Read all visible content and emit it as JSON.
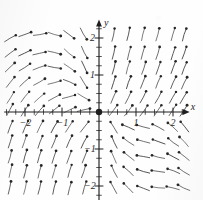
{
  "figure": {
    "kind": "direction-field",
    "background_color": "#fefefe",
    "ink_color": "#1e1e1e",
    "arrow_color": "#3a3a3a"
  },
  "axes": {
    "x_label": "x",
    "y_label": "y",
    "x_ticks": [
      {
        "value": -2,
        "label": "−2"
      },
      {
        "value": -1,
        "label": "−1"
      },
      {
        "value": 1,
        "label": "1"
      },
      {
        "value": 2,
        "label": "2"
      }
    ],
    "y_ticks": [
      {
        "value": 2,
        "label": "2"
      },
      {
        "value": 1,
        "label": "1"
      },
      {
        "value": -1,
        "label": "−1"
      },
      {
        "value": -2,
        "label": "−2"
      }
    ],
    "x_minor_tick_values": [
      -2.5,
      -2.25,
      -2,
      -1.75,
      -1.5,
      -1.25,
      -1,
      -0.75,
      -0.5,
      -0.25,
      0.25,
      0.5,
      0.75,
      1,
      1.25,
      1.5,
      1.75,
      2,
      2.25
    ],
    "y_minor_tick_values": [
      -2.25,
      -2,
      -1.75,
      -1.5,
      -1.25,
      -1,
      -0.75,
      -0.5,
      -0.25,
      0.25,
      0.5,
      0.75,
      1,
      1.25,
      1.5,
      1.75,
      2,
      2.25
    ],
    "x_range": [
      -2.55,
      2.45
    ],
    "y_range": [
      -2.45,
      2.5
    ],
    "x_axis_arrow": true,
    "y_axis_arrow": true,
    "grid": false
  },
  "equilibrium_point": {
    "x": 0,
    "y": 0,
    "marker": "filled-dot",
    "radius_px": 3.2
  },
  "chart_data": {
    "type": "scatter",
    "title": "",
    "xlabel": "x",
    "ylabel": "y",
    "xlim": [
      -2.55,
      2.45
    ],
    "ylim": [
      -2.45,
      2.5
    ],
    "grid": false,
    "legend": null,
    "sample_spacing": 0.4,
    "vector_length_px": 13,
    "arrowhead": "filled-dot",
    "field": {
      "u_expression": "-x - y",
      "v_expression": "x - y + 2*x",
      "note": "Vectors drawn as short segments with a dot head marking the direction of flow."
    },
    "vectors": [
      {
        "x": -2.4,
        "y": 2.0,
        "u": 0.86,
        "v": 0.5
      },
      {
        "x": -2.0,
        "y": 2.1,
        "u": 0.94,
        "v": 0.34
      },
      {
        "x": -1.6,
        "y": 2.1,
        "u": 0.98,
        "v": 0.17
      },
      {
        "x": -1.2,
        "y": 2.1,
        "u": 0.96,
        "v": -0.28
      },
      {
        "x": -0.8,
        "y": 2.1,
        "u": 0.8,
        "v": -0.6
      },
      {
        "x": -0.4,
        "y": 2.1,
        "u": 0.5,
        "v": -0.86
      },
      {
        "x": -2.4,
        "y": 1.6,
        "u": 0.8,
        "v": 0.6
      },
      {
        "x": -2.0,
        "y": 1.6,
        "u": 0.9,
        "v": 0.43
      },
      {
        "x": -1.6,
        "y": 1.6,
        "u": 0.97,
        "v": 0.22
      },
      {
        "x": -1.2,
        "y": 1.6,
        "u": 0.97,
        "v": -0.24
      },
      {
        "x": -0.8,
        "y": 1.6,
        "u": 0.77,
        "v": -0.64
      },
      {
        "x": -0.4,
        "y": 1.6,
        "u": 0.45,
        "v": -0.89
      },
      {
        "x": -2.4,
        "y": 1.2,
        "u": 0.72,
        "v": 0.69
      },
      {
        "x": -2.0,
        "y": 1.2,
        "u": 0.84,
        "v": 0.54
      },
      {
        "x": -1.6,
        "y": 1.2,
        "u": 0.94,
        "v": 0.34
      },
      {
        "x": -1.2,
        "y": 1.2,
        "u": 0.98,
        "v": -0.17
      },
      {
        "x": -0.8,
        "y": 1.2,
        "u": 0.82,
        "v": -0.57
      },
      {
        "x": -0.4,
        "y": 1.2,
        "u": 0.42,
        "v": -0.91
      },
      {
        "x": -2.4,
        "y": 0.8,
        "u": 0.62,
        "v": 0.78
      },
      {
        "x": -2.0,
        "y": 0.8,
        "u": 0.74,
        "v": 0.67
      },
      {
        "x": -1.6,
        "y": 0.8,
        "u": 0.87,
        "v": 0.5
      },
      {
        "x": -1.2,
        "y": 0.8,
        "u": 0.96,
        "v": 0.26
      },
      {
        "x": -0.8,
        "y": 0.8,
        "u": 0.92,
        "v": -0.4
      },
      {
        "x": -0.4,
        "y": 0.8,
        "u": 0.52,
        "v": -0.85
      },
      {
        "x": -2.4,
        "y": 0.4,
        "u": 0.52,
        "v": 0.85
      },
      {
        "x": -2.0,
        "y": 0.4,
        "u": 0.62,
        "v": 0.78
      },
      {
        "x": -1.6,
        "y": 0.4,
        "u": 0.75,
        "v": 0.66
      },
      {
        "x": -1.2,
        "y": 0.4,
        "u": 0.88,
        "v": 0.47
      },
      {
        "x": -0.8,
        "y": 0.4,
        "u": 0.96,
        "v": 0.26
      },
      {
        "x": -0.4,
        "y": 0.4,
        "u": 0.86,
        "v": -0.5
      },
      {
        "x": -2.4,
        "y": 0.05,
        "u": 0.47,
        "v": 0.88
      },
      {
        "x": -2.0,
        "y": 0.05,
        "u": 0.55,
        "v": 0.84
      },
      {
        "x": -1.6,
        "y": 0.05,
        "u": 0.66,
        "v": 0.75
      },
      {
        "x": -1.2,
        "y": 0.05,
        "u": 0.78,
        "v": 0.63
      },
      {
        "x": -0.8,
        "y": 0.05,
        "u": 0.9,
        "v": 0.43
      },
      {
        "x": -0.4,
        "y": 0.05,
        "u": 0.97,
        "v": 0.22
      },
      {
        "x": -2.4,
        "y": -0.4,
        "u": 0.36,
        "v": 0.93
      },
      {
        "x": -2.0,
        "y": -0.4,
        "u": 0.4,
        "v": 0.92
      },
      {
        "x": -1.6,
        "y": -0.4,
        "u": 0.45,
        "v": 0.89
      },
      {
        "x": -1.2,
        "y": -0.4,
        "u": 0.5,
        "v": 0.87
      },
      {
        "x": -0.8,
        "y": -0.4,
        "u": 0.55,
        "v": 0.84
      },
      {
        "x": -0.4,
        "y": -0.4,
        "u": 0.62,
        "v": 0.79
      },
      {
        "x": -2.4,
        "y": -0.8,
        "u": 0.3,
        "v": 0.95
      },
      {
        "x": -2.0,
        "y": -0.8,
        "u": 0.32,
        "v": 0.95
      },
      {
        "x": -1.6,
        "y": -0.8,
        "u": 0.35,
        "v": 0.94
      },
      {
        "x": -1.2,
        "y": -0.8,
        "u": 0.38,
        "v": 0.93
      },
      {
        "x": -0.8,
        "y": -0.8,
        "u": 0.42,
        "v": 0.91
      },
      {
        "x": -0.4,
        "y": -0.8,
        "u": 0.46,
        "v": 0.89
      },
      {
        "x": -2.4,
        "y": -1.2,
        "u": 0.26,
        "v": 0.97
      },
      {
        "x": -2.0,
        "y": -1.2,
        "u": 0.27,
        "v": 0.96
      },
      {
        "x": -1.6,
        "y": -1.2,
        "u": 0.29,
        "v": 0.96
      },
      {
        "x": -1.2,
        "y": -1.2,
        "u": 0.31,
        "v": 0.95
      },
      {
        "x": -0.8,
        "y": -1.2,
        "u": 0.34,
        "v": 0.94
      },
      {
        "x": -0.4,
        "y": -1.2,
        "u": 0.37,
        "v": 0.93
      },
      {
        "x": -2.4,
        "y": -1.6,
        "u": 0.23,
        "v": 0.97
      },
      {
        "x": -2.0,
        "y": -1.6,
        "u": 0.24,
        "v": 0.97
      },
      {
        "x": -1.6,
        "y": -1.6,
        "u": 0.25,
        "v": 0.97
      },
      {
        "x": -1.2,
        "y": -1.6,
        "u": 0.27,
        "v": 0.96
      },
      {
        "x": -0.8,
        "y": -1.6,
        "u": 0.29,
        "v": 0.96
      },
      {
        "x": -0.4,
        "y": -1.6,
        "u": 0.31,
        "v": 0.95
      },
      {
        "x": -2.4,
        "y": -2.05,
        "u": 0.21,
        "v": 0.98
      },
      {
        "x": -2.0,
        "y": -2.05,
        "u": 0.22,
        "v": 0.98
      },
      {
        "x": -1.6,
        "y": -2.05,
        "u": 0.23,
        "v": 0.97
      },
      {
        "x": -1.2,
        "y": -2.05,
        "u": 0.24,
        "v": 0.97
      },
      {
        "x": -0.8,
        "y": -2.05,
        "u": 0.26,
        "v": 0.97
      },
      {
        "x": -0.4,
        "y": -2.05,
        "u": 0.28,
        "v": 0.96
      },
      {
        "x": 0.4,
        "y": 2.1,
        "u": 0.2,
        "v": 0.98
      },
      {
        "x": 0.8,
        "y": 2.1,
        "u": 0.22,
        "v": 0.98
      },
      {
        "x": 1.2,
        "y": 2.1,
        "u": 0.24,
        "v": 0.97
      },
      {
        "x": 1.6,
        "y": 2.1,
        "u": 0.26,
        "v": 0.97
      },
      {
        "x": 2.0,
        "y": 2.1,
        "u": 0.28,
        "v": 0.96
      },
      {
        "x": 2.3,
        "y": 2.1,
        "u": 0.3,
        "v": 0.95
      },
      {
        "x": 0.4,
        "y": 1.6,
        "u": 0.22,
        "v": 0.97
      },
      {
        "x": 0.8,
        "y": 1.6,
        "u": 0.25,
        "v": 0.97
      },
      {
        "x": 1.2,
        "y": 1.6,
        "u": 0.27,
        "v": 0.96
      },
      {
        "x": 1.6,
        "y": 1.6,
        "u": 0.29,
        "v": 0.96
      },
      {
        "x": 2.0,
        "y": 1.6,
        "u": 0.31,
        "v": 0.95
      },
      {
        "x": 2.3,
        "y": 1.6,
        "u": 0.33,
        "v": 0.94
      },
      {
        "x": 0.4,
        "y": 1.2,
        "u": 0.25,
        "v": 0.97
      },
      {
        "x": 0.8,
        "y": 1.2,
        "u": 0.28,
        "v": 0.96
      },
      {
        "x": 1.2,
        "y": 1.2,
        "u": 0.31,
        "v": 0.95
      },
      {
        "x": 1.6,
        "y": 1.2,
        "u": 0.33,
        "v": 0.94
      },
      {
        "x": 2.0,
        "y": 1.2,
        "u": 0.35,
        "v": 0.94
      },
      {
        "x": 2.3,
        "y": 1.2,
        "u": 0.37,
        "v": 0.93
      },
      {
        "x": 0.4,
        "y": 0.8,
        "u": 0.3,
        "v": 0.95
      },
      {
        "x": 0.8,
        "y": 0.8,
        "u": 0.34,
        "v": 0.94
      },
      {
        "x": 1.2,
        "y": 0.8,
        "u": 0.37,
        "v": 0.93
      },
      {
        "x": 1.6,
        "y": 0.8,
        "u": 0.39,
        "v": 0.92
      },
      {
        "x": 2.0,
        "y": 0.8,
        "u": 0.41,
        "v": 0.91
      },
      {
        "x": 2.3,
        "y": 0.8,
        "u": 0.43,
        "v": 0.9
      },
      {
        "x": 0.4,
        "y": 0.4,
        "u": 0.4,
        "v": 0.92
      },
      {
        "x": 0.8,
        "y": 0.4,
        "u": 0.44,
        "v": 0.9
      },
      {
        "x": 1.2,
        "y": 0.4,
        "u": 0.46,
        "v": 0.89
      },
      {
        "x": 1.6,
        "y": 0.4,
        "u": 0.48,
        "v": 0.88
      },
      {
        "x": 2.0,
        "y": 0.4,
        "u": 0.5,
        "v": 0.87
      },
      {
        "x": 2.3,
        "y": 0.4,
        "u": 0.51,
        "v": 0.86
      },
      {
        "x": 0.4,
        "y": 0.05,
        "u": 0.6,
        "v": 0.8
      },
      {
        "x": 0.8,
        "y": 0.05,
        "u": 0.6,
        "v": 0.8
      },
      {
        "x": 1.2,
        "y": 0.05,
        "u": 0.58,
        "v": 0.81
      },
      {
        "x": 1.6,
        "y": 0.05,
        "u": 0.56,
        "v": 0.83
      },
      {
        "x": 2.0,
        "y": 0.05,
        "u": 0.55,
        "v": 0.84
      },
      {
        "x": 2.3,
        "y": 0.05,
        "u": 0.54,
        "v": 0.84
      },
      {
        "x": 0.4,
        "y": -0.4,
        "u": -0.52,
        "v": 0.85
      },
      {
        "x": 0.8,
        "y": -0.4,
        "u": -0.92,
        "v": 0.4
      },
      {
        "x": 1.2,
        "y": -0.4,
        "u": -0.96,
        "v": 0.26
      },
      {
        "x": 1.6,
        "y": -0.4,
        "u": -0.88,
        "v": 0.47
      },
      {
        "x": 2.0,
        "y": -0.4,
        "u": -0.75,
        "v": 0.66
      },
      {
        "x": 2.3,
        "y": -0.4,
        "u": -0.62,
        "v": 0.78
      },
      {
        "x": 0.4,
        "y": -0.8,
        "u": -0.42,
        "v": 0.91
      },
      {
        "x": 0.8,
        "y": -0.8,
        "u": -0.82,
        "v": 0.57
      },
      {
        "x": 1.2,
        "y": -0.8,
        "u": -0.96,
        "v": 0.26
      },
      {
        "x": 1.6,
        "y": -0.8,
        "u": -0.94,
        "v": 0.34
      },
      {
        "x": 2.0,
        "y": -0.8,
        "u": -0.8,
        "v": 0.6
      },
      {
        "x": 2.3,
        "y": -0.8,
        "u": -0.68,
        "v": 0.73
      },
      {
        "x": 0.4,
        "y": -1.2,
        "u": -0.4,
        "v": 0.92
      },
      {
        "x": 0.8,
        "y": -1.2,
        "u": -0.78,
        "v": 0.62
      },
      {
        "x": 1.2,
        "y": -1.2,
        "u": -0.98,
        "v": 0.17
      },
      {
        "x": 1.6,
        "y": -1.2,
        "u": -0.97,
        "v": 0.24
      },
      {
        "x": 2.0,
        "y": -1.2,
        "u": -0.88,
        "v": 0.47
      },
      {
        "x": 2.3,
        "y": -1.2,
        "u": -0.78,
        "v": 0.62
      },
      {
        "x": 0.4,
        "y": -1.6,
        "u": -0.44,
        "v": 0.9
      },
      {
        "x": 0.8,
        "y": -1.6,
        "u": -0.74,
        "v": 0.67
      },
      {
        "x": 1.2,
        "y": -1.6,
        "u": -0.96,
        "v": 0.28
      },
      {
        "x": 1.6,
        "y": -1.6,
        "u": -0.99,
        "v": 0.14
      },
      {
        "x": 2.0,
        "y": -1.6,
        "u": -0.93,
        "v": 0.36
      },
      {
        "x": 2.3,
        "y": -1.6,
        "u": -0.84,
        "v": 0.54
      },
      {
        "x": 0.4,
        "y": -2.05,
        "u": -0.48,
        "v": 0.88
      },
      {
        "x": 0.8,
        "y": -2.05,
        "u": -0.7,
        "v": 0.71
      },
      {
        "x": 1.2,
        "y": -2.05,
        "u": -0.93,
        "v": 0.36
      },
      {
        "x": 1.6,
        "y": -2.05,
        "u": -0.99,
        "v": 0.1
      },
      {
        "x": 2.0,
        "y": -2.05,
        "u": -0.97,
        "v": 0.24
      },
      {
        "x": 2.3,
        "y": -2.05,
        "u": -0.9,
        "v": 0.43
      }
    ]
  }
}
